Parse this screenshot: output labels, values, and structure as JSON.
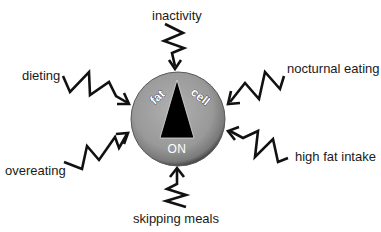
{
  "diagram": {
    "center": {
      "title_left": "fat",
      "title_right": "cell",
      "state": "ON",
      "indicator": "pointer-triangle-up",
      "colors": {
        "disc": "#9a9a9a",
        "disc_edge": "#555555",
        "pointer": "#000000",
        "text": "#ffffff"
      }
    },
    "factors": [
      {
        "id": "inactivity",
        "label": "inactivity",
        "position": "top"
      },
      {
        "id": "dieting",
        "label": "dieting",
        "position": "upper-left"
      },
      {
        "id": "nocturnal-eating",
        "label": "nocturnal eating",
        "position": "upper-right"
      },
      {
        "id": "high-fat-intake",
        "label": "high fat intake",
        "position": "lower-right"
      },
      {
        "id": "overeating",
        "label": "overeating",
        "position": "lower-left"
      },
      {
        "id": "skipping-meals",
        "label": "skipping meals",
        "position": "bottom"
      }
    ],
    "arrow_style": "zigzag-lightning-arrow"
  }
}
